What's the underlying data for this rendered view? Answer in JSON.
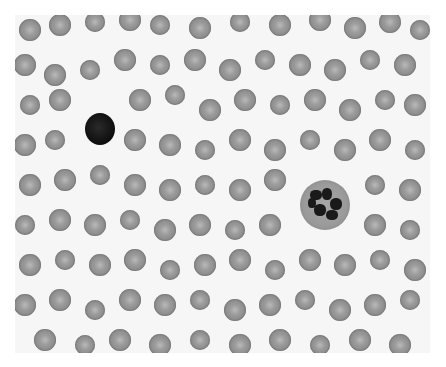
{
  "image": {
    "subject": "peripheral blood smear micrograph (grayscale)",
    "colors": {
      "background": "#f6f6f6",
      "rbc": "#9a9a9a",
      "lymphocyte": "#111111",
      "neutrophil_cytoplasm": "#a0a0a0",
      "nucleus": "#1a1a1a"
    },
    "lymphocyte": {
      "x": 100,
      "y": 128,
      "d": 30
    },
    "neutrophil": {
      "x": 325,
      "y": 205,
      "d": 50
    },
    "rbcs": [
      [
        30,
        30,
        22
      ],
      [
        60,
        25,
        22
      ],
      [
        95,
        22,
        20
      ],
      [
        130,
        20,
        22
      ],
      [
        160,
        25,
        20
      ],
      [
        200,
        28,
        22
      ],
      [
        240,
        22,
        20
      ],
      [
        280,
        25,
        22
      ],
      [
        320,
        20,
        22
      ],
      [
        355,
        28,
        22
      ],
      [
        390,
        22,
        22
      ],
      [
        420,
        30,
        20
      ],
      [
        25,
        65,
        22
      ],
      [
        55,
        75,
        22
      ],
      [
        90,
        70,
        20
      ],
      [
        125,
        60,
        22
      ],
      [
        160,
        65,
        20
      ],
      [
        195,
        60,
        22
      ],
      [
        230,
        70,
        22
      ],
      [
        265,
        60,
        20
      ],
      [
        300,
        65,
        22
      ],
      [
        335,
        70,
        22
      ],
      [
        370,
        60,
        20
      ],
      [
        405,
        65,
        22
      ],
      [
        30,
        105,
        20
      ],
      [
        60,
        100,
        22
      ],
      [
        140,
        100,
        22
      ],
      [
        175,
        95,
        20
      ],
      [
        210,
        110,
        22
      ],
      [
        245,
        100,
        22
      ],
      [
        280,
        105,
        20
      ],
      [
        315,
        100,
        22
      ],
      [
        350,
        110,
        22
      ],
      [
        385,
        100,
        20
      ],
      [
        415,
        105,
        22
      ],
      [
        25,
        145,
        22
      ],
      [
        55,
        140,
        20
      ],
      [
        135,
        140,
        22
      ],
      [
        170,
        145,
        22
      ],
      [
        205,
        150,
        20
      ],
      [
        240,
        140,
        22
      ],
      [
        275,
        150,
        22
      ],
      [
        310,
        140,
        20
      ],
      [
        345,
        150,
        22
      ],
      [
        380,
        140,
        22
      ],
      [
        415,
        150,
        20
      ],
      [
        30,
        185,
        22
      ],
      [
        65,
        180,
        22
      ],
      [
        100,
        175,
        20
      ],
      [
        135,
        185,
        22
      ],
      [
        170,
        190,
        22
      ],
      [
        205,
        185,
        20
      ],
      [
        240,
        190,
        22
      ],
      [
        275,
        180,
        22
      ],
      [
        375,
        185,
        20
      ],
      [
        410,
        190,
        22
      ],
      [
        25,
        225,
        20
      ],
      [
        60,
        220,
        22
      ],
      [
        95,
        225,
        22
      ],
      [
        130,
        220,
        20
      ],
      [
        165,
        230,
        22
      ],
      [
        200,
        225,
        22
      ],
      [
        235,
        230,
        20
      ],
      [
        270,
        225,
        22
      ],
      [
        375,
        225,
        22
      ],
      [
        410,
        230,
        20
      ],
      [
        30,
        265,
        22
      ],
      [
        65,
        260,
        20
      ],
      [
        100,
        265,
        22
      ],
      [
        135,
        260,
        22
      ],
      [
        170,
        270,
        20
      ],
      [
        205,
        265,
        22
      ],
      [
        240,
        260,
        22
      ],
      [
        275,
        270,
        20
      ],
      [
        310,
        260,
        22
      ],
      [
        345,
        265,
        22
      ],
      [
        380,
        260,
        20
      ],
      [
        415,
        270,
        22
      ],
      [
        25,
        305,
        22
      ],
      [
        60,
        300,
        22
      ],
      [
        95,
        310,
        20
      ],
      [
        130,
        300,
        22
      ],
      [
        165,
        305,
        22
      ],
      [
        200,
        300,
        20
      ],
      [
        235,
        310,
        22
      ],
      [
        270,
        305,
        22
      ],
      [
        305,
        300,
        20
      ],
      [
        340,
        310,
        22
      ],
      [
        375,
        305,
        22
      ],
      [
        410,
        300,
        20
      ],
      [
        45,
        340,
        22
      ],
      [
        85,
        345,
        20
      ],
      [
        120,
        340,
        22
      ],
      [
        160,
        345,
        22
      ],
      [
        200,
        340,
        20
      ],
      [
        240,
        345,
        22
      ],
      [
        280,
        340,
        22
      ],
      [
        320,
        345,
        20
      ],
      [
        360,
        340,
        22
      ],
      [
        400,
        345,
        22
      ]
    ]
  }
}
